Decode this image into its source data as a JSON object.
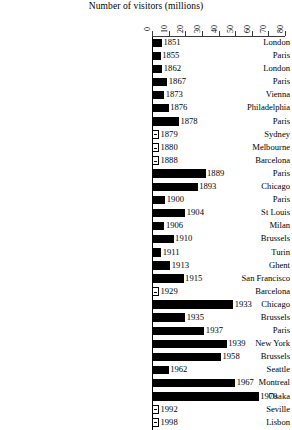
{
  "chart_data": {
    "type": "bar",
    "orientation": "horizontal",
    "title": "Number of visitors (millions)",
    "xlabel": "Number of visitors (millions)",
    "ylabel": "",
    "xlim": [
      0,
      80
    ],
    "xticks": [
      0,
      10,
      20,
      30,
      40,
      50,
      60,
      70,
      80
    ],
    "xticklabels": [
      "0",
      "10",
      "20",
      "30",
      "40",
      "50",
      "60",
      "70",
      "80"
    ],
    "grid": false,
    "legend": false,
    "categories": [
      "London",
      "Paris",
      "London",
      "Paris",
      "Vienna",
      "Philadelphia",
      "Paris",
      "Sydney",
      "Melbourne",
      "Barcelona",
      "Paris",
      "Chicago",
      "Paris",
      "St Louis",
      "Milan",
      "Brussels",
      "Turin",
      "Ghent",
      "San Francisco",
      "Barcelona",
      "Chicago",
      "Brussels",
      "Paris",
      "New York",
      "Brussels",
      "Seattle",
      "Montreal",
      "Osaka",
      "Seville",
      "Lisbon"
    ],
    "point_labels": [
      "1851",
      "1855",
      "1862",
      "1867",
      "1873",
      "1876",
      "1878",
      "1879",
      "1880",
      "1888",
      "1889",
      "1893",
      "1900",
      "1904",
      "1906",
      "1910",
      "1911",
      "1913",
      "1915",
      "1929",
      "1933",
      "1935",
      "1937",
      "1939",
      "1958",
      "1962",
      "1967",
      "1970",
      "1992",
      "1998"
    ],
    "values": [
      6.0,
      5.2,
      6.2,
      9.2,
      7.3,
      10.0,
      16.2,
      1.1,
      1.3,
      0.4,
      32.2,
      27.5,
      8.0,
      20.0,
      7.5,
      13.0,
      5.5,
      11.0,
      19.0,
      0.6,
      48.8,
      20.0,
      31.5,
      45.0,
      41.5,
      10.0,
      50.0,
      64.2,
      0.8,
      1.0
    ],
    "bar_color": "#000000",
    "axis_color": "#3a3a3a"
  }
}
